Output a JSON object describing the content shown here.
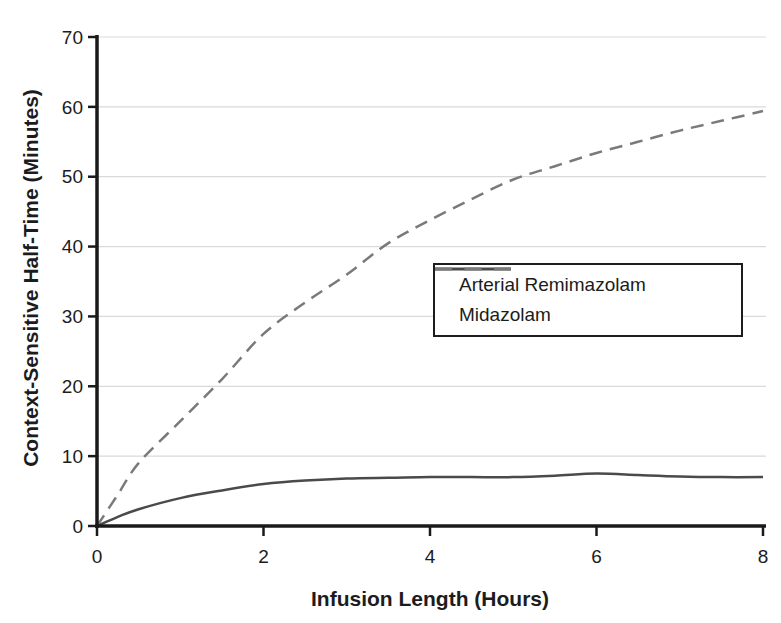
{
  "figure": {
    "background": "#ffffff",
    "width": 781,
    "height": 623
  },
  "chart_data": {
    "type": "line",
    "title": "",
    "xlabel": "Infusion Length (Hours)",
    "ylabel": "Context-Sensitive Half-Time (Minutes)",
    "xlim": [
      0,
      8
    ],
    "ylim": [
      0,
      70
    ],
    "xticks": [
      0,
      2,
      4,
      6,
      8
    ],
    "yticks": [
      0,
      10,
      20,
      30,
      40,
      50,
      60,
      70
    ],
    "grid": "horizontal-only",
    "legend_position": "inside-middle-right",
    "x": [
      0,
      0.25,
      0.5,
      1,
      1.5,
      2,
      2.5,
      3,
      3.5,
      4,
      4.5,
      5,
      5.5,
      6,
      6.5,
      7,
      7.5,
      8
    ],
    "series": [
      {
        "name": "Arterial Remimazolam",
        "style": "solid",
        "color": "#4a4a4a",
        "values": [
          0,
          1.3,
          2.4,
          4.0,
          5.1,
          6.0,
          6.5,
          6.8,
          6.9,
          7.0,
          7.0,
          7.0,
          7.2,
          7.5,
          7.3,
          7.1,
          7.0,
          7.0
        ]
      },
      {
        "name": "Midazolam",
        "style": "dashed",
        "color": "#7a7a7a",
        "values": [
          0,
          4.5,
          9.0,
          15.0,
          21.0,
          27.5,
          32.0,
          36.0,
          40.5,
          43.8,
          46.8,
          49.6,
          51.5,
          53.4,
          55.0,
          56.6,
          58.0,
          59.4
        ]
      }
    ]
  },
  "colors": {
    "axis": "#1a1a1a",
    "grid": "#d9d9d9",
    "text": "#1c1c1c"
  }
}
